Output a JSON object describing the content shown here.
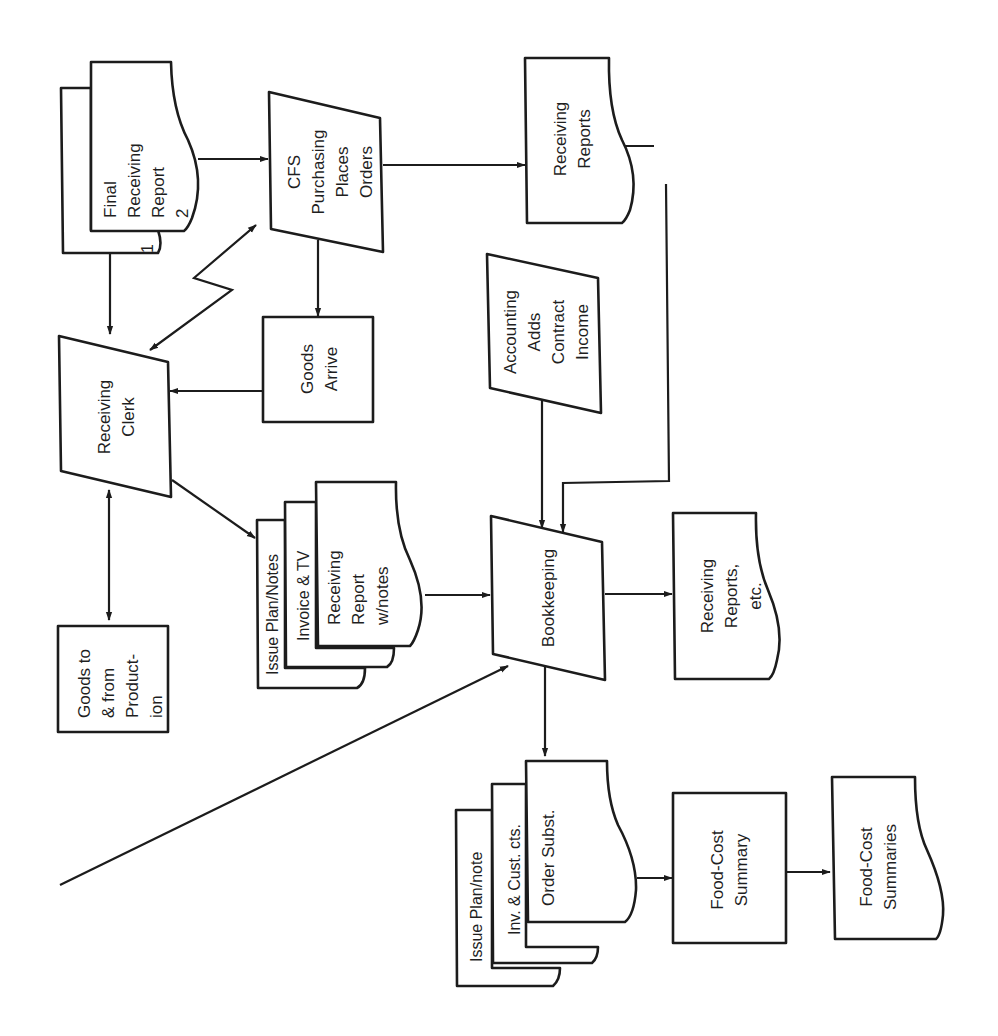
{
  "diagram": {
    "orientation": "rotated 90° counter-clockwise",
    "nodes": {
      "final_receiving_report": {
        "shape": "document (2 copies)",
        "lines": [
          "Final",
          "Receiving",
          "Report",
          "2"
        ],
        "copy_back_label": "1"
      },
      "cfs_purchasing": {
        "shape": "manual operation",
        "lines": [
          "CFS",
          "Purchasing",
          "Places",
          "Orders"
        ]
      },
      "receiving_reports_top": {
        "shape": "document",
        "lines": [
          "Receiving",
          "Reports"
        ]
      },
      "receiving_clerk": {
        "shape": "manual operation",
        "lines": [
          "Receiving",
          "Clerk"
        ]
      },
      "goods_arrive": {
        "shape": "process",
        "lines": [
          "Goods",
          "Arrive"
        ]
      },
      "accounting_adds": {
        "shape": "manual operation",
        "lines": [
          "Accounting",
          "Adds",
          "Contract",
          "Income"
        ]
      },
      "goods_to_from_production": {
        "shape": "process",
        "lines": [
          "Goods to",
          "& from",
          "Product-",
          "ion"
        ]
      },
      "clerk_docs": {
        "shape": "document stack",
        "pages": [
          {
            "lines": [
              "Issue Plan/Notes"
            ]
          },
          {
            "lines": [
              "Invoice & TV"
            ]
          },
          {
            "lines": [
              "Receiving",
              "Report",
              "w/notes"
            ]
          }
        ]
      },
      "bookkeeping": {
        "shape": "manual operation",
        "lines": [
          "Bookkeeping"
        ]
      },
      "receiving_reports_etc": {
        "shape": "document",
        "lines": [
          "Receiving",
          "Reports,",
          "etc."
        ]
      },
      "bookkeeping_docs": {
        "shape": "document stack",
        "pages": [
          {
            "lines": [
              "Issue Plan/note"
            ]
          },
          {
            "lines": [
              "Inv. & Cust. cts."
            ]
          },
          {
            "lines": [
              "Order Subst."
            ]
          }
        ]
      },
      "food_cost_summary": {
        "shape": "process",
        "lines": [
          "Food-Cost",
          "Summary"
        ]
      },
      "food_cost_summaries": {
        "shape": "document",
        "lines": [
          "Food-Cost",
          "Summaries"
        ]
      }
    },
    "edges": [
      {
        "from": "final_receiving_report",
        "to": "cfs_purchasing"
      },
      {
        "from": "final_receiving_report",
        "to": "receiving_clerk"
      },
      {
        "from": "cfs_purchasing",
        "to": "receiving_reports_top"
      },
      {
        "from": "cfs_purchasing",
        "to": "goods_arrive"
      },
      {
        "from": "cfs_purchasing",
        "to": "receiving_clerk",
        "style": "zigzag (communication link), bidirectional"
      },
      {
        "from": "goods_arrive",
        "to": "receiving_clerk"
      },
      {
        "from": "receiving_clerk",
        "to": "goods_to_from_production",
        "style": "bidirectional"
      },
      {
        "from": "receiving_clerk",
        "to": "clerk_docs"
      },
      {
        "from": "clerk_docs",
        "to": "bookkeeping"
      },
      {
        "from": "accounting_adds",
        "to": "bookkeeping"
      },
      {
        "from": "receiving_reports_top",
        "to": "bookkeeping",
        "style": "elbow connector"
      },
      {
        "from": "off-page (bottom-left)",
        "to": "bookkeeping"
      },
      {
        "from": "bookkeeping",
        "to": "receiving_reports_etc"
      },
      {
        "from": "bookkeeping",
        "to": "bookkeeping_docs"
      },
      {
        "from": "bookkeeping_docs",
        "to": "food_cost_summary"
      },
      {
        "from": "food_cost_summary",
        "to": "food_cost_summaries"
      }
    ],
    "colors": {
      "stroke": "#1c1c1c",
      "background": "#ffffff",
      "text": "#1f1f1f"
    }
  }
}
